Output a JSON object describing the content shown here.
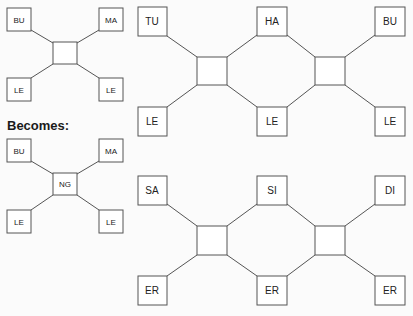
{
  "caption": "Becomes:",
  "small_before": {
    "center": "",
    "nodes": [
      "BU",
      "MA",
      "LE",
      "LE"
    ]
  },
  "small_after": {
    "center": "NG",
    "nodes": [
      "BU",
      "MA",
      "LE",
      "LE"
    ]
  },
  "large_before": {
    "top": [
      "TU",
      "HA",
      "BU"
    ],
    "bottom": [
      "LE",
      "LE",
      "LE"
    ],
    "centers": [
      "",
      ""
    ]
  },
  "large_after": {
    "top": [
      "SA",
      "SI",
      "DI"
    ],
    "bottom": [
      "ER",
      "ER",
      "ER"
    ],
    "centers": [
      "",
      ""
    ]
  },
  "colors": {
    "line": "#555555",
    "box_fill": "#ffffff",
    "text": "#222222"
  }
}
